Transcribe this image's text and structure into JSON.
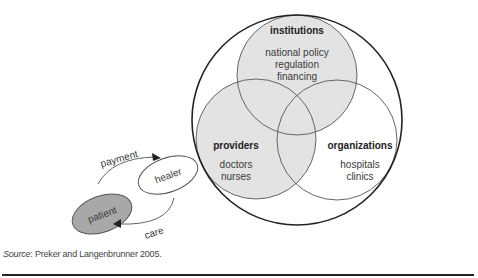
{
  "diagram": {
    "colors": {
      "filled_circle": "#e3e3e3",
      "patient_fill": "#a8a8a8",
      "stroke": "#555555",
      "outer_stroke": "#222222"
    },
    "circles": {
      "institutions": {
        "title": "institutions",
        "lines": [
          "national policy",
          "regulation",
          "financing"
        ]
      },
      "providers": {
        "title": "providers",
        "lines": [
          "doctors",
          "nurses"
        ]
      },
      "organizations": {
        "title": "organizations",
        "lines": [
          "hospitals",
          "clinics"
        ]
      }
    },
    "relationship": {
      "patient": "patient",
      "healer": "healer",
      "payment": "payment",
      "care": "care"
    }
  },
  "source": {
    "label": "Source",
    "text": ": Preker and Langenbrunner 2005."
  }
}
